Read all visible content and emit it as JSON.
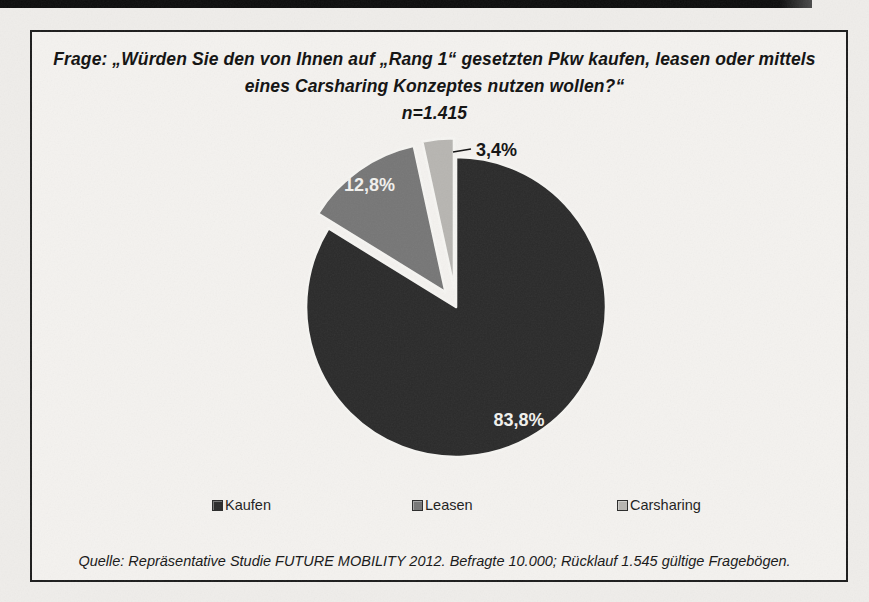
{
  "title": {
    "line1": "Frage: „Würden Sie den von Ihnen auf „Rang 1“ gesetzten Pkw kaufen, leasen oder mittels",
    "line2": "eines Carsharing Konzeptes nutzen wollen?“",
    "n": "n=1.415"
  },
  "legend": {
    "items": [
      {
        "label": "Kaufen",
        "color": "#2a2a2a"
      },
      {
        "label": "Leasen",
        "color": "#767676"
      },
      {
        "label": "Carsharing",
        "color": "#b7b5b1"
      }
    ]
  },
  "source": {
    "text": "Quelle: Repräsentative Studie FUTURE MOBILITY 2012. Befragte 10.000; Rücklauf 1.545 gültige Fragebögen."
  },
  "chart_data": {
    "type": "pie",
    "title": "Frage: „Würden Sie den von Ihnen auf „Rang 1“ gesetzten Pkw kaufen, leasen oder mittels eines Carsharing Konzeptes nutzen wollen?“",
    "subtitle": "n=1.415",
    "categories": [
      "Kaufen",
      "Leasen",
      "Carsharing"
    ],
    "values": [
      83.8,
      12.8,
      3.4
    ],
    "data_labels": [
      "83,8%",
      "12,8%",
      "3,4%"
    ],
    "colors": [
      "#2a2a2a",
      "#767676",
      "#b7b5b1"
    ],
    "legend_position": "bottom",
    "source": "Quelle: Repräsentative Studie FUTURE MOBILITY 2012. Befragte 10.000; Rücklauf 1.545 gültige Fragebögen.",
    "layout": {
      "center": [
        456,
        307
      ],
      "radius": 150,
      "start_angle_deg": 0,
      "direction": "clockwise",
      "gap_color": "#f6f5f2",
      "gap_width": 2.6,
      "label_font_size": 18,
      "slices": [
        {
          "explode": 0,
          "label_mode": "inside",
          "label_r_frac": 0.86,
          "label_color": "#f2f1ee"
        },
        {
          "explode": 18,
          "label_mode": "inside",
          "label_r_frac": 0.88,
          "label_color": "#f2f1ee"
        },
        {
          "explode": 19,
          "label_mode": "callout",
          "callout_from": [
            453,
            152
          ],
          "callout_to": [
            471,
            149
          ],
          "label_xy": [
            476,
            156
          ],
          "label_color": "#111111"
        }
      ]
    }
  }
}
